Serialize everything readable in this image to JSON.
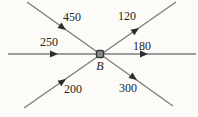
{
  "diagram": {
    "type": "flow-junction",
    "junction": {
      "label": "B"
    },
    "branches": [
      {
        "position": "upper-left",
        "label": "450",
        "arrow_direction": "toward-junction"
      },
      {
        "position": "upper-right",
        "label": "120",
        "arrow_direction": "away-from-junction"
      },
      {
        "position": "left",
        "label": "250",
        "arrow_direction": "toward-junction"
      },
      {
        "position": "right",
        "label": "180",
        "arrow_direction": "away-from-junction"
      },
      {
        "position": "lower-left",
        "label": "200",
        "arrow_direction": "toward-junction"
      },
      {
        "position": "lower-right",
        "label": "300",
        "arrow_direction": "away-from-junction"
      }
    ],
    "colors": {
      "background": "#fcfbf7",
      "line": "#7e7e7e",
      "arrow": "#2d2d2d",
      "text": "#242424",
      "node_fill": "#8a8a8a",
      "node_stroke": "#3a3a3a"
    }
  }
}
